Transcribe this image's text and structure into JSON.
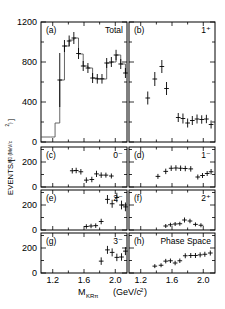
{
  "figure": {
    "xlabel_main": "M",
    "xlabel_sub": "KRπ",
    "xlabel_units": "(GeV/c",
    "xlabel_units_sup": "2",
    "xlabel_units_close": ")",
    "ylabel_main": "EVENTS/[",
    "ylabel_sub": "60 (MeV/c",
    "ylabel_sub_sup": "2",
    "ylabel_sub_close": ")",
    "ylabel_close": "]"
  },
  "chart_data": {
    "type": "scatter",
    "title": "",
    "xlabel": "M_KRπ (GeV/c^2)",
    "ylabel": "EVENTS/[60 (MeV/c^2)]",
    "xlim": [
      1.05,
      2.15
    ],
    "xticks": [
      1.2,
      1.6,
      2.0
    ],
    "xticklabels": [
      "1.2",
      "1.6",
      "2.0"
    ],
    "bin_width_gev": 0.06,
    "panels": [
      {
        "tag": "(a)",
        "title": "Total",
        "row": 0,
        "col": 0,
        "ylim": [
          0,
          1200
        ],
        "yticks": [
          0,
          400,
          800,
          1200
        ],
        "yticklabels": [
          "0",
          "400",
          "800",
          "1200"
        ],
        "has_histogram": true,
        "histogram_x": [
          1.05,
          1.17,
          1.23,
          1.29,
          1.35,
          1.41,
          1.47,
          1.53,
          1.59,
          1.65,
          1.71,
          1.77,
          1.83,
          1.89,
          1.95,
          2.01,
          2.07,
          2.13
        ],
        "histogram_y": [
          50,
          50,
          190,
          620,
          960,
          1020,
          1040,
          880,
          760,
          740,
          640,
          630,
          630,
          790,
          800,
          870,
          780,
          690
        ],
        "points": [
          {
            "x": 1.29,
            "y": 620,
            "ey": 270
          },
          {
            "x": 1.35,
            "y": 960,
            "ey": 60
          },
          {
            "x": 1.41,
            "y": 1010,
            "ey": 55
          },
          {
            "x": 1.47,
            "y": 1040,
            "ey": 60
          },
          {
            "x": 1.53,
            "y": 885,
            "ey": 55
          },
          {
            "x": 1.59,
            "y": 760,
            "ey": 50
          },
          {
            "x": 1.65,
            "y": 740,
            "ey": 50
          },
          {
            "x": 1.71,
            "y": 640,
            "ey": 50
          },
          {
            "x": 1.77,
            "y": 632,
            "ey": 48
          },
          {
            "x": 1.83,
            "y": 632,
            "ey": 48
          },
          {
            "x": 1.89,
            "y": 790,
            "ey": 50
          },
          {
            "x": 1.95,
            "y": 800,
            "ey": 50
          },
          {
            "x": 2.01,
            "y": 870,
            "ey": 52
          },
          {
            "x": 2.07,
            "y": 780,
            "ey": 50
          },
          {
            "x": 2.13,
            "y": 690,
            "ey": 50
          }
        ]
      },
      {
        "tag": "(b)",
        "title": "1⁺",
        "row": 0,
        "col": 1,
        "ylim": [
          0,
          1200
        ],
        "yticks": [
          0,
          400,
          800,
          1200
        ],
        "yticklabels": [
          "",
          "",
          "",
          ""
        ],
        "has_histogram": false,
        "points": [
          {
            "x": 1.29,
            "y": 440,
            "ey": 65
          },
          {
            "x": 1.38,
            "y": 630,
            "ey": 70
          },
          {
            "x": 1.47,
            "y": 755,
            "ey": 65
          },
          {
            "x": 1.53,
            "y": 535,
            "ey": 65
          },
          {
            "x": 1.68,
            "y": 245,
            "ey": 45
          },
          {
            "x": 1.74,
            "y": 235,
            "ey": 50
          },
          {
            "x": 1.8,
            "y": 190,
            "ey": 45
          },
          {
            "x": 1.86,
            "y": 215,
            "ey": 45
          },
          {
            "x": 1.92,
            "y": 230,
            "ey": 45
          },
          {
            "x": 1.98,
            "y": 225,
            "ey": 42
          },
          {
            "x": 2.04,
            "y": 230,
            "ey": 42
          },
          {
            "x": 2.1,
            "y": 175,
            "ey": 40
          }
        ]
      },
      {
        "tag": "(c)",
        "title": "0⁻",
        "row": 1,
        "col": 0,
        "ylim": [
          0,
          320
        ],
        "yticks": [
          0,
          200
        ],
        "yticklabels": [
          "0",
          "200"
        ],
        "has_histogram": false,
        "points": [
          {
            "x": 1.45,
            "y": 130,
            "ey": 22
          },
          {
            "x": 1.5,
            "y": 132,
            "ey": 22
          },
          {
            "x": 1.56,
            "y": 122,
            "ey": 22
          },
          {
            "x": 1.63,
            "y": 55,
            "ey": 22
          },
          {
            "x": 1.7,
            "y": 60,
            "ey": 22
          },
          {
            "x": 1.76,
            "y": 105,
            "ey": 25
          },
          {
            "x": 1.82,
            "y": 95,
            "ey": 22
          },
          {
            "x": 1.88,
            "y": 95,
            "ey": 20
          },
          {
            "x": 1.95,
            "y": 88,
            "ey": 20
          }
        ]
      },
      {
        "tag": "(d)",
        "title": "1⁻",
        "row": 1,
        "col": 1,
        "ylim": [
          0,
          320
        ],
        "yticks": [
          0,
          200
        ],
        "yticklabels": [
          "",
          ""
        ],
        "has_histogram": false,
        "points": [
          {
            "x": 1.42,
            "y": 85,
            "ey": 20
          },
          {
            "x": 1.52,
            "y": 125,
            "ey": 22
          },
          {
            "x": 1.59,
            "y": 150,
            "ey": 22
          },
          {
            "x": 1.65,
            "y": 152,
            "ey": 22
          },
          {
            "x": 1.71,
            "y": 150,
            "ey": 22
          },
          {
            "x": 1.77,
            "y": 148,
            "ey": 22
          },
          {
            "x": 1.84,
            "y": 145,
            "ey": 22
          },
          {
            "x": 1.93,
            "y": 80,
            "ey": 20
          },
          {
            "x": 1.99,
            "y": 92,
            "ey": 20
          },
          {
            "x": 2.05,
            "y": 108,
            "ey": 20
          },
          {
            "x": 2.1,
            "y": 122,
            "ey": 22
          }
        ]
      },
      {
        "tag": "(e)",
        "title": "2⁻",
        "row": 2,
        "col": 0,
        "ylim": [
          0,
          320
        ],
        "yticks": [
          0,
          200
        ],
        "yticklabels": [
          "0",
          "200"
        ],
        "has_histogram": false,
        "points": [
          {
            "x": 1.63,
            "y": 28,
            "ey": 18
          },
          {
            "x": 1.69,
            "y": 32,
            "ey": 18
          },
          {
            "x": 1.75,
            "y": 35,
            "ey": 18
          },
          {
            "x": 1.82,
            "y": 68,
            "ey": 22
          },
          {
            "x": 1.9,
            "y": 245,
            "ey": 35
          },
          {
            "x": 1.96,
            "y": 210,
            "ey": 32
          },
          {
            "x": 2.02,
            "y": 260,
            "ey": 38
          },
          {
            "x": 2.08,
            "y": 200,
            "ey": 35
          },
          {
            "x": 2.13,
            "y": 185,
            "ey": 35
          }
        ]
      },
      {
        "tag": "(f)",
        "title": "2⁺",
        "row": 2,
        "col": 1,
        "ylim": [
          0,
          320
        ],
        "yticks": [
          0,
          200
        ],
        "yticklabels": [
          "",
          ""
        ],
        "has_histogram": false,
        "points": [
          {
            "x": 1.52,
            "y": 32,
            "ey": 16
          },
          {
            "x": 1.58,
            "y": 42,
            "ey": 16
          },
          {
            "x": 1.64,
            "y": 48,
            "ey": 16
          },
          {
            "x": 1.7,
            "y": 50,
            "ey": 16
          },
          {
            "x": 1.76,
            "y": 80,
            "ey": 20
          },
          {
            "x": 1.83,
            "y": 72,
            "ey": 18
          },
          {
            "x": 1.9,
            "y": 45,
            "ey": 16
          },
          {
            "x": 1.97,
            "y": 38,
            "ey": 16
          }
        ]
      },
      {
        "tag": "(g)",
        "title": "3⁻",
        "row": 3,
        "col": 0,
        "ylim": [
          0,
          320
        ],
        "yticks": [
          0,
          200
        ],
        "yticklabels": [
          "0",
          "200"
        ],
        "has_histogram": false,
        "points": [
          {
            "x": 1.82,
            "y": 95,
            "ey": 30
          },
          {
            "x": 1.9,
            "y": 185,
            "ey": 32
          },
          {
            "x": 1.96,
            "y": 165,
            "ey": 32
          },
          {
            "x": 2.02,
            "y": 125,
            "ey": 30
          },
          {
            "x": 2.08,
            "y": 128,
            "ey": 30
          },
          {
            "x": 2.13,
            "y": 175,
            "ey": 32
          }
        ]
      },
      {
        "tag": "(h)",
        "title": "Phase Space",
        "row": 3,
        "col": 1,
        "ylim": [
          0,
          320
        ],
        "yticks": [
          0,
          200
        ],
        "yticklabels": [
          "",
          ""
        ],
        "has_histogram": false,
        "points": [
          {
            "x": 1.38,
            "y": 55,
            "ey": 16
          },
          {
            "x": 1.46,
            "y": 62,
            "ey": 16
          },
          {
            "x": 1.52,
            "y": 95,
            "ey": 18
          },
          {
            "x": 1.58,
            "y": 98,
            "ey": 18
          },
          {
            "x": 1.64,
            "y": 80,
            "ey": 18
          },
          {
            "x": 1.7,
            "y": 98,
            "ey": 18
          },
          {
            "x": 1.77,
            "y": 138,
            "ey": 20
          },
          {
            "x": 1.84,
            "y": 140,
            "ey": 20
          },
          {
            "x": 1.9,
            "y": 140,
            "ey": 20
          },
          {
            "x": 1.96,
            "y": 145,
            "ey": 20
          },
          {
            "x": 2.02,
            "y": 150,
            "ey": 20
          },
          {
            "x": 2.09,
            "y": 160,
            "ey": 20
          }
        ]
      }
    ]
  }
}
